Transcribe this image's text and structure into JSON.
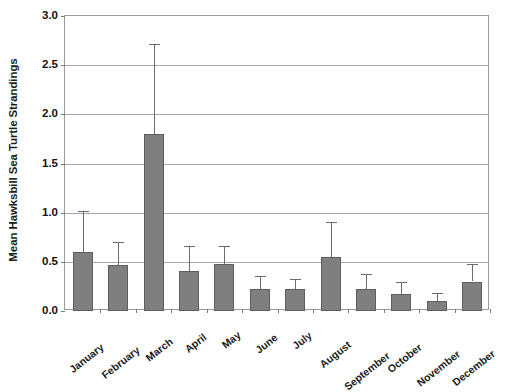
{
  "chart_data": {
    "type": "bar",
    "title": "",
    "subtitle": "",
    "xlabel": "",
    "ylabel": "Mean Hawksbill Sea Turtle Strandings",
    "categories": [
      "January",
      "February",
      "March",
      "April",
      "May",
      "June",
      "July",
      "August",
      "September",
      "October",
      "November",
      "December"
    ],
    "values": [
      0.6,
      0.47,
      1.8,
      0.41,
      0.48,
      0.22,
      0.22,
      0.55,
      0.22,
      0.17,
      0.1,
      0.3
    ],
    "error_upper": [
      1.02,
      0.7,
      2.72,
      0.66,
      0.66,
      0.36,
      0.33,
      0.91,
      0.38,
      0.3,
      0.18,
      0.48
    ],
    "errors": [
      0.42,
      0.23,
      0.92,
      0.25,
      0.18,
      0.14,
      0.11,
      0.36,
      0.16,
      0.13,
      0.08,
      0.18
    ],
    "ylim": [
      0.0,
      3.0
    ],
    "yticks": [
      "0.0",
      "0.5",
      "1.0",
      "1.5",
      "2.0",
      "2.5",
      "3.0"
    ],
    "ytick_values": [
      0.0,
      0.5,
      1.0,
      1.5,
      2.0,
      2.5,
      3.0
    ],
    "grid": true,
    "grid_axis": "y",
    "legend": "none",
    "bar_color": "#7f7f7f",
    "bar_edge_color": "#5e5e5e",
    "error_bar_color": "#6b6b6b",
    "axis_color": "#9a9a9a",
    "grid_color": "#a8a8a8",
    "background": "#ffffff"
  }
}
